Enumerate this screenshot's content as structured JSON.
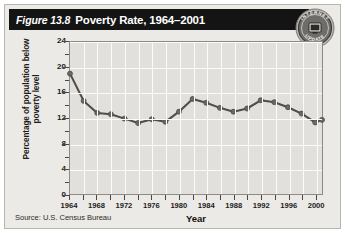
{
  "figure": {
    "number": "Figure 13.8",
    "title": "Poverty Rate, 1964–2001",
    "source": "Source: U.S. Census Bureau"
  },
  "seal": {
    "top_text": "INTERNET",
    "bottom_text": "UPDATE",
    "icon": "computer-monitor-icon"
  },
  "colors": {
    "title_bar": "#141414",
    "card_background": "#eceae6",
    "plot_background": "#e2e0dc",
    "gridline": "#fbfbfa",
    "series_line": "#4f4d4a",
    "marker": "#6b6965",
    "axis": "#8e8a84"
  },
  "chart_data": {
    "type": "line",
    "title": "Poverty Rate, 1964–2001",
    "xlabel": "Year",
    "ylabel": "Percentage of population below poverty level",
    "xlim": [
      1964,
      2001
    ],
    "ylim": [
      0,
      24
    ],
    "yticks": [
      0,
      4,
      8,
      12,
      16,
      20,
      24
    ],
    "ytick_minor_step": 2,
    "xticks": [
      1964,
      1968,
      1972,
      1976,
      1980,
      1984,
      1988,
      1992,
      1996,
      2000
    ],
    "grid": true,
    "legend": "none",
    "markers": true,
    "x": [
      1964,
      1966,
      1968,
      1970,
      1972,
      1974,
      1976,
      1978,
      1980,
      1982,
      1984,
      1986,
      1988,
      1990,
      1992,
      1994,
      1996,
      1998,
      2000,
      2001
    ],
    "values": [
      19.0,
      14.7,
      12.8,
      12.6,
      11.9,
      11.2,
      11.8,
      11.4,
      13.0,
      15.0,
      14.4,
      13.6,
      13.0,
      13.5,
      14.8,
      14.5,
      13.7,
      12.7,
      11.3,
      11.7
    ],
    "series": [
      {
        "name": "Poverty rate",
        "values": [
          19.0,
          14.7,
          12.8,
          12.6,
          11.9,
          11.2,
          11.8,
          11.4,
          13.0,
          15.0,
          14.4,
          13.6,
          13.0,
          13.5,
          14.8,
          14.5,
          13.7,
          12.7,
          11.3,
          11.7
        ]
      }
    ]
  }
}
